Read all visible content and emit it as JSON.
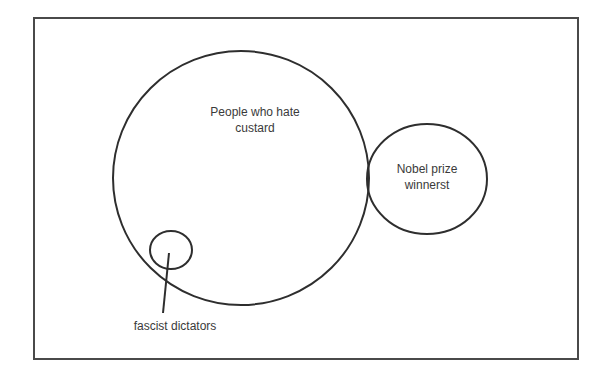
{
  "diagram": {
    "type": "venn",
    "sets": [
      {
        "id": "custard-haters",
        "label_line1": "People who hate",
        "label_line2": "custard",
        "shape": {
          "cx": 241,
          "cy": 178,
          "rx": 128,
          "ry": 127
        }
      },
      {
        "id": "nobel-winners",
        "label_line1": "Nobel prize",
        "label_line2": "winnerst",
        "shape": {
          "cx": 427,
          "cy": 179,
          "rx": 60,
          "ry": 55
        }
      },
      {
        "id": "fascist-dictators",
        "label": "fascist dictators",
        "shape": {
          "cx": 171,
          "cy": 250,
          "rx": 21,
          "ry": 19
        }
      }
    ],
    "relations": [
      "fascist dictators is a subset of People who hate custard",
      "Nobel prize winnerst slightly overlaps People who hate custard"
    ],
    "colors": {
      "stroke": "#2e2e2e",
      "frame": "#4a4a4a",
      "text": "#3a3a3a",
      "background": "#ffffff"
    }
  }
}
